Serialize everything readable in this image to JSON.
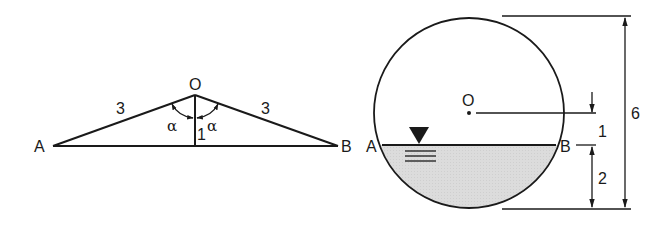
{
  "figure_left": {
    "title": "Triangle AOB",
    "labels": {
      "apex": "O",
      "left": "A",
      "right": "B",
      "side_left": "3",
      "side_right": "3",
      "height": "1",
      "angle_left": "α",
      "angle_right": "α"
    }
  },
  "figure_right": {
    "title": "Circular tank partially filled with water",
    "labels": {
      "center": "O",
      "chord_left": "A",
      "chord_right": "B",
      "dim_center_to_chord": "1",
      "dim_chord_to_bottom": "2",
      "dim_diameter": "6"
    },
    "colors": {
      "water_fill": "#d9d9d9",
      "line": "#1a1a1a"
    }
  }
}
